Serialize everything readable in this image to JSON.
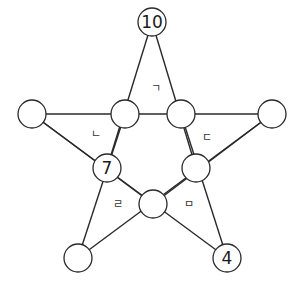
{
  "diagram": {
    "type": "star-puzzle",
    "nodes": [
      {
        "id": "top",
        "x": 152,
        "y": 22,
        "value": "10"
      },
      {
        "id": "outer-left",
        "x": 32,
        "y": 114,
        "value": ""
      },
      {
        "id": "inner-left",
        "x": 125,
        "y": 114,
        "value": ""
      },
      {
        "id": "inner-right",
        "x": 181,
        "y": 114,
        "value": ""
      },
      {
        "id": "outer-right",
        "x": 272,
        "y": 114,
        "value": ""
      },
      {
        "id": "mid-left",
        "x": 107,
        "y": 168,
        "value": "7"
      },
      {
        "id": "mid-right",
        "x": 196,
        "y": 168,
        "value": ""
      },
      {
        "id": "bottom-center",
        "x": 153,
        "y": 204,
        "value": ""
      },
      {
        "id": "bottom-left",
        "x": 78,
        "y": 258,
        "value": ""
      },
      {
        "id": "bottom-right",
        "x": 227,
        "y": 258,
        "value": "4"
      }
    ],
    "region_labels": [
      {
        "text": "ㄱ",
        "x": 156,
        "y": 88
      },
      {
        "text": "ㄴ",
        "x": 96,
        "y": 134
      },
      {
        "text": "ㄷ",
        "x": 207,
        "y": 137
      },
      {
        "text": "ㄹ",
        "x": 118,
        "y": 204
      },
      {
        "text": "ㅁ",
        "x": 189,
        "y": 204
      }
    ]
  }
}
